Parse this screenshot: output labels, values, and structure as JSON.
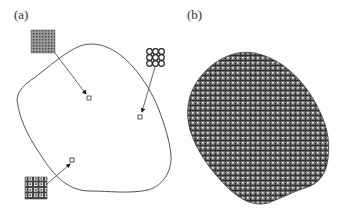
{
  "figure": {
    "panels": [
      {
        "id": "a",
        "label": "(a)",
        "description": "Closed boundary outline with three inset lattice patches pointing to interior locations"
      },
      {
        "id": "b",
        "label": "(b)",
        "description": "Region filled with lattice microstructure"
      }
    ],
    "colors": {
      "outline": "#555555",
      "lattice_dark": "#333333",
      "lattice_mid": "#7a7a7a",
      "background": "#ffffff"
    },
    "panel_a": {
      "patches": [
        {
          "name": "dense-grid-patch",
          "x": 31,
          "y": 30,
          "size": 24,
          "target": [
            89,
            98
          ]
        },
        {
          "name": "circle-grid-patch",
          "x": 146,
          "y": 48,
          "size": 19,
          "target": [
            140,
            117
          ]
        },
        {
          "name": "mixed-grid-patch",
          "x": 25,
          "y": 177,
          "size": 22,
          "target": [
            72,
            161
          ]
        }
      ]
    }
  }
}
